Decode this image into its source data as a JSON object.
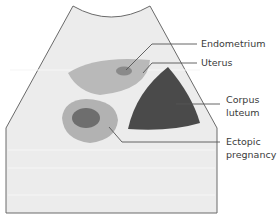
{
  "diagram": {
    "labels": {
      "endometrium": "Endometrium",
      "uterus": "Uterus",
      "corpus_luteum_line1": "Corpus",
      "corpus_luteum_line2": "luteum",
      "ectopic_line1": "Ectopic",
      "ectopic_line2": "pregnancy"
    },
    "colors": {
      "background": "#ffffff",
      "scan_field": "#ececec",
      "scan_border": "#6a6a6a",
      "uterus": "#b9b9b9",
      "endometrium": "#8a8a8a",
      "corpus_luteum": "#4a4a4a",
      "ectopic_sac": "#b2b2b2",
      "ectopic_core": "#6e6e6e",
      "leader_line": "#555555"
    }
  }
}
